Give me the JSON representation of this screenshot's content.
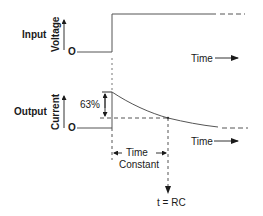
{
  "diagram": {
    "input": {
      "row_label": "Input",
      "axis_label": "Voltage",
      "origin_label": "O",
      "time_label": "Time"
    },
    "output": {
      "row_label": "Output",
      "axis_label": "Current",
      "origin_label": "O",
      "time_label": "Time",
      "percent_label": "63%"
    },
    "time_constant": {
      "line1": "Time",
      "line2": "Constant",
      "formula": "t = RC"
    },
    "colors": {
      "line": "#333333",
      "text": "#1a1a1a",
      "background": "#ffffff"
    }
  }
}
